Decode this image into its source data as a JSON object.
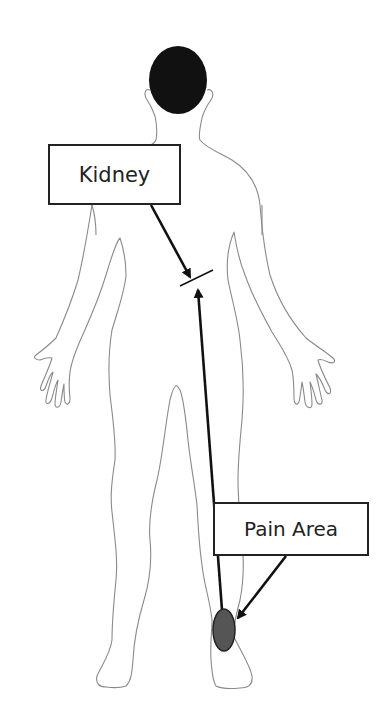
{
  "diagram": {
    "type": "referred-pain body diagram",
    "labels": {
      "kidney": "Kidney",
      "pain_area": "Pain Area"
    },
    "colors": {
      "outline": "#8a8a8a",
      "head_fill": "#111111",
      "arrow": "#111111",
      "box_border": "#222222",
      "pain_spot_fill": "#555555",
      "background": "#ffffff"
    },
    "elements": [
      {
        "name": "body-outline",
        "description": "Human figure, back view, head filled black"
      },
      {
        "name": "kidney-label",
        "text": "Kidney",
        "arrow_to": "nerve-junction"
      },
      {
        "name": "nerve-junction",
        "description": "Short cross line where arrows meet"
      },
      {
        "name": "pain-area-label",
        "text": "Pain Area",
        "arrow_to": "pain-spot"
      },
      {
        "name": "pain-spot",
        "description": "Dark ellipse on right lower leg / ankle"
      },
      {
        "name": "referral-arrow",
        "description": "Arrow from pain spot up to nerve junction"
      }
    ]
  }
}
